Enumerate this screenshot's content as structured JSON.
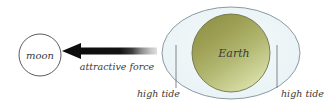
{
  "diagram": {
    "background_color": "#ffffff"
  },
  "moon": {
    "label": "moon",
    "fill_color": "#ffffff",
    "stroke_color": "#4a4a4a",
    "center_x": 40,
    "center_y": 55,
    "radius": 21
  },
  "arrow": {
    "label": "attractive force",
    "head_color": "#111111",
    "tail_fade_color": "#cfcfcf",
    "direction": "left",
    "tip_x": 62,
    "tail_x": 157,
    "y": 51
  },
  "earth": {
    "label": "Earth",
    "fill_start_color": "#9a9c52",
    "fill_mid_color": "#a8ad63",
    "fill_end_color": "#d5dca4",
    "stroke_color": "#6d7145",
    "center_x": 231,
    "center_y": 53,
    "radius": 39
  },
  "ocean_bulge": {
    "fill_color": "#eef5f7",
    "stroke_color": "#7a8a92",
    "center_x": 231,
    "center_y": 53,
    "radius_x": 69,
    "radius_y": 46
  },
  "tides": [
    {
      "label": "high tide",
      "side": "left",
      "line_x": 176,
      "line_top_y": 45,
      "line_bottom_y": 88,
      "text_x": 137,
      "text_y": 96
    },
    {
      "label": "high tide",
      "side": "right",
      "line_x": 277,
      "line_top_y": 45,
      "line_bottom_y": 88,
      "text_x": 281,
      "text_y": 96
    }
  ],
  "colors": {
    "line_gray": "#6b6b6b",
    "text_dark": "#3a3a38"
  }
}
